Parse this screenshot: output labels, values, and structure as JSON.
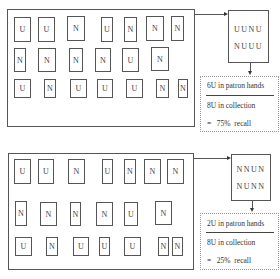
{
  "scenarios": [
    {
      "name": "high-recall",
      "collection_rows": [
        [
          "U",
          "U",
          "N",
          "U",
          "N",
          "N",
          "N"
        ],
        [
          "N",
          "N",
          "N",
          "N",
          "U",
          "N"
        ],
        [
          "U",
          "N",
          "U",
          "U",
          "U",
          "N",
          "N"
        ]
      ],
      "sample": {
        "line1": "UUNU",
        "line2": "NUUU"
      },
      "calc": {
        "numerator": "6U in patron hands",
        "denominator": "8U in collection",
        "result": "=   75%  recall"
      }
    },
    {
      "name": "low-recall",
      "collection_rows": [
        [
          "U",
          "U",
          "N",
          "U",
          "N",
          "N",
          "N"
        ],
        [
          "N",
          "N",
          "N",
          "N",
          "U",
          "N"
        ],
        [
          "U",
          "N",
          "U",
          "U",
          "U",
          "N",
          "N"
        ]
      ],
      "sample": {
        "line1": "NNUN",
        "line2": "NUNN"
      },
      "calc": {
        "numerator": "2U in patron hands",
        "denominator": "8U in collection",
        "result": "=   25%  recall"
      }
    }
  ]
}
